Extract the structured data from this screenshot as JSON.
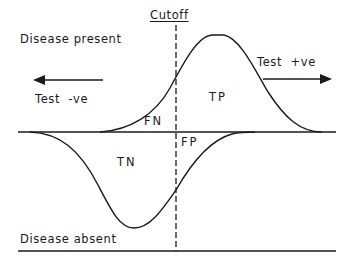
{
  "diagram": {
    "cutoff_label": "Cutoff",
    "population_labels": {
      "present": "Disease present",
      "absent": "Disease absent"
    },
    "direction_labels": {
      "negative": "Test  -ve",
      "positive": "Test  +ve"
    },
    "region_labels": {
      "fn": "FN",
      "tp": "TP",
      "tn": "TN",
      "fp": "FP"
    },
    "arrows": {
      "negative_direction": "left",
      "positive_direction": "right"
    },
    "colors": {
      "line": "#1a1a1a",
      "background": "#ffffff"
    }
  }
}
